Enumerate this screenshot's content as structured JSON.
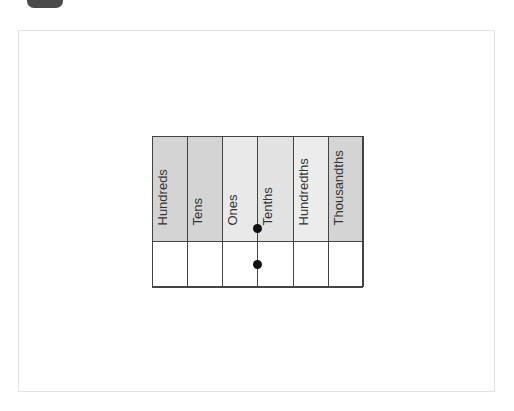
{
  "diagram": {
    "columns": [
      {
        "label": "Hundreds",
        "shade": "#d4d4d4"
      },
      {
        "label": "Tens",
        "shade": "#d4d4d4"
      },
      {
        "label": "Ones",
        "shade": "#e9e9e9"
      },
      {
        "label": "Tenths",
        "shade": "#e2e2e2"
      },
      {
        "label": "Hundredths",
        "shade": "#ececec"
      },
      {
        "label": "Thousandths",
        "shade": "#d4d4d4"
      }
    ],
    "decimal_point_markers": [
      {
        "position": "between Ones and Tenths header"
      },
      {
        "position": "between Ones and Tenths value row"
      }
    ],
    "line_color": "#444444",
    "frame_color": "#e3e3e3"
  }
}
